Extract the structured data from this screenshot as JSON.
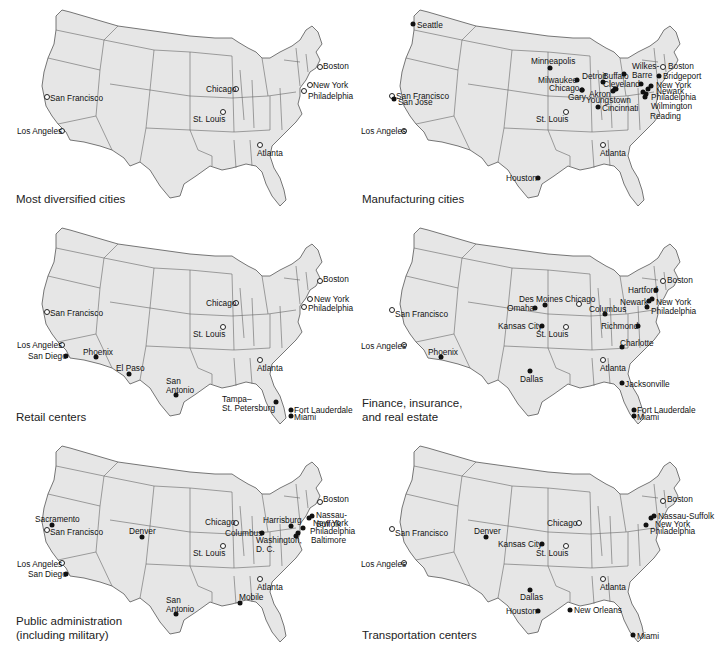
{
  "colors": {
    "land": "#e6e6e6",
    "border": "#555555",
    "dot": "#111111",
    "background": "#ffffff"
  },
  "legend": {
    "filled_dot": "city in category",
    "open_dot": "diversified reference city"
  },
  "panels": [
    {
      "id": "diversified",
      "caption": "Most diversified cities",
      "left": 0,
      "top": 0,
      "cities": [
        {
          "name": "Boston",
          "x": 320,
          "y": 67,
          "tx": 323,
          "ty": 62,
          "open": true
        },
        {
          "name": "New York",
          "x": 310,
          "y": 85,
          "tx": 313,
          "ty": 81,
          "open": true
        },
        {
          "name": "Philadelphia",
          "x": 304,
          "y": 91,
          "tx": 308,
          "ty": 92,
          "open": true
        },
        {
          "name": "Chicago",
          "x": 236,
          "y": 89,
          "tx": 206,
          "ty": 85,
          "open": true
        },
        {
          "name": "San Francisco",
          "x": 47,
          "y": 97,
          "tx": 50,
          "ty": 94,
          "open": true
        },
        {
          "name": "St. Louis",
          "x": 223,
          "y": 112,
          "tx": 193,
          "ty": 115,
          "open": true
        },
        {
          "name": "Los Angeles",
          "x": 62,
          "y": 131,
          "tx": 17,
          "ty": 127,
          "open": true
        },
        {
          "name": "Atlanta",
          "x": 260,
          "y": 145,
          "tx": 257,
          "ty": 149,
          "open": true
        }
      ]
    },
    {
      "id": "manufacturing",
      "caption": "Manufacturing cities",
      "left": 358,
      "top": 0,
      "cities": [
        {
          "name": "Seattle",
          "x": 55,
          "y": 24,
          "tx": 59,
          "ty": 21,
          "open": false
        },
        {
          "name": "Minneapolis",
          "x": 192,
          "y": 68,
          "tx": 173,
          "ty": 57,
          "open": false
        },
        {
          "name": "Boston",
          "x": 305,
          "y": 67,
          "tx": 310,
          "ty": 62,
          "open": true
        },
        {
          "name": "Wilkes-\nBarre",
          "x": 283,
          "y": 84,
          "tx": 274,
          "ty": 62,
          "open": false
        },
        {
          "name": "Buffalo",
          "x": 266,
          "y": 74,
          "tx": 245,
          "ty": 72,
          "open": false
        },
        {
          "name": "Bridgeport",
          "x": 301,
          "y": 76,
          "tx": 305,
          "ty": 72,
          "open": false
        },
        {
          "name": "Detroit",
          "x": 245,
          "y": 82,
          "tx": 224,
          "ty": 72,
          "open": false
        },
        {
          "name": "Milwaukee",
          "x": 219,
          "y": 80,
          "tx": 180,
          "ty": 76,
          "open": false
        },
        {
          "name": "Cleveland",
          "x": 257,
          "y": 89,
          "tx": 245,
          "ty": 80,
          "open": false
        },
        {
          "name": "New York",
          "x": 293,
          "y": 86,
          "tx": 298,
          "ty": 81,
          "open": false
        },
        {
          "name": "Chicago",
          "x": 224,
          "y": 90,
          "tx": 191,
          "ty": 84,
          "open": false
        },
        {
          "name": "Akron",
          "x": 255,
          "y": 91,
          "tx": 231,
          "ty": 90,
          "open": false
        },
        {
          "name": "Newark",
          "x": 290,
          "y": 89,
          "tx": 298,
          "ty": 87,
          "open": false
        },
        {
          "name": "San Francisco",
          "x": 34,
          "y": 96,
          "tx": 38,
          "ty": 92,
          "open": true
        },
        {
          "name": "San Jose",
          "x": 36,
          "y": 99,
          "tx": 40,
          "ty": 98,
          "open": false
        },
        {
          "name": "Youngstown",
          "x": 258,
          "y": 89,
          "tx": 228,
          "ty": 96,
          "open": false
        },
        {
          "name": "Gary",
          "x": 224,
          "y": 90,
          "tx": 210,
          "ty": 93,
          "open": false
        },
        {
          "name": "Philadelphia",
          "x": 288,
          "y": 94,
          "tx": 293,
          "ty": 93,
          "open": false
        },
        {
          "name": "Cincinnati",
          "x": 240,
          "y": 107,
          "tx": 244,
          "ty": 104,
          "open": false
        },
        {
          "name": "Wilmington",
          "x": 287,
          "y": 97,
          "tx": 293,
          "ty": 102,
          "open": false
        },
        {
          "name": "St. Louis",
          "x": 208,
          "y": 112,
          "tx": 178,
          "ty": 115,
          "open": true
        },
        {
          "name": "Reading",
          "x": 285,
          "y": 92,
          "tx": 292,
          "ty": 112,
          "open": false
        },
        {
          "name": "Los Angeles",
          "x": 46,
          "y": 131,
          "tx": 3,
          "ty": 127,
          "open": true
        },
        {
          "name": "Atlanta",
          "x": 245,
          "y": 145,
          "tx": 242,
          "ty": 149,
          "open": true
        },
        {
          "name": "Houston",
          "x": 180,
          "y": 178,
          "tx": 148,
          "ty": 174,
          "open": false
        }
      ]
    },
    {
      "id": "retail",
      "caption": "Retail centers",
      "left": 0,
      "top": 218,
      "cities": [
        {
          "name": "Boston",
          "x": 320,
          "y": 63,
          "tx": 323,
          "ty": 57,
          "open": true
        },
        {
          "name": "New York",
          "x": 310,
          "y": 81,
          "tx": 314,
          "ty": 77,
          "open": true
        },
        {
          "name": "Chicago",
          "x": 236,
          "y": 85,
          "tx": 206,
          "ty": 81,
          "open": true
        },
        {
          "name": "Philadelphia",
          "x": 304,
          "y": 89,
          "tx": 308,
          "ty": 86,
          "open": true
        },
        {
          "name": "San Francisco",
          "x": 47,
          "y": 94,
          "tx": 50,
          "ty": 91,
          "open": true
        },
        {
          "name": "St. Louis",
          "x": 223,
          "y": 109,
          "tx": 193,
          "ty": 112,
          "open": true
        },
        {
          "name": "Los Angeles",
          "x": 62,
          "y": 127,
          "tx": 17,
          "ty": 123,
          "open": true
        },
        {
          "name": "San Diego",
          "x": 66,
          "y": 138,
          "tx": 28,
          "ty": 134,
          "open": false
        },
        {
          "name": "Phoenix",
          "x": 96,
          "y": 139,
          "tx": 83,
          "ty": 130,
          "open": false
        },
        {
          "name": "El Paso",
          "x": 129,
          "y": 156,
          "tx": 116,
          "ty": 146,
          "open": false
        },
        {
          "name": "Atlanta",
          "x": 260,
          "y": 142,
          "tx": 257,
          "ty": 146,
          "open": true
        },
        {
          "name": "San\nAntonio",
          "x": 176,
          "y": 177,
          "tx": 166,
          "ty": 159,
          "open": false
        },
        {
          "name": "Tampa–\nSt. Petersburg",
          "x": 276,
          "y": 184,
          "tx": 222,
          "ty": 177,
          "open": false
        },
        {
          "name": "Fort Lauderdale",
          "x": 291,
          "y": 192,
          "tx": 294,
          "ty": 188,
          "open": false
        },
        {
          "name": "Miami",
          "x": 291,
          "y": 198,
          "tx": 294,
          "ty": 195,
          "open": false
        }
      ]
    },
    {
      "id": "finance",
      "caption": "Finance, insurance,\nand real estate",
      "left": 358,
      "top": 218,
      "cities": [
        {
          "name": "Boston",
          "x": 305,
          "y": 63,
          "tx": 309,
          "ty": 58,
          "open": true
        },
        {
          "name": "Hartford",
          "x": 298,
          "y": 72,
          "tx": 270,
          "ty": 68,
          "open": false
        },
        {
          "name": "Newark",
          "x": 291,
          "y": 83,
          "tx": 262,
          "ty": 80,
          "open": false
        },
        {
          "name": "New York",
          "x": 294,
          "y": 81,
          "tx": 298,
          "ty": 80,
          "open": false
        },
        {
          "name": "Des Moines",
          "x": 187,
          "y": 87,
          "tx": 161,
          "ty": 77,
          "open": false
        },
        {
          "name": "Chicago",
          "x": 221,
          "y": 86,
          "tx": 207,
          "ty": 77,
          "open": true
        },
        {
          "name": "Philadelphia",
          "x": 289,
          "y": 89,
          "tx": 293,
          "ty": 89,
          "open": false
        },
        {
          "name": "Omaha",
          "x": 177,
          "y": 90,
          "tx": 149,
          "ty": 86,
          "open": false
        },
        {
          "name": "Columbus",
          "x": 247,
          "y": 96,
          "tx": 231,
          "ty": 87,
          "open": false
        },
        {
          "name": "San Francisco",
          "x": 34,
          "y": 92,
          "tx": 37,
          "ty": 92,
          "open": true
        },
        {
          "name": "Kansas City",
          "x": 184,
          "y": 108,
          "tx": 140,
          "ty": 104,
          "open": false
        },
        {
          "name": "Richmond",
          "x": 280,
          "y": 108,
          "tx": 243,
          "ty": 104,
          "open": false
        },
        {
          "name": "St. Louis",
          "x": 208,
          "y": 109,
          "tx": 178,
          "ty": 112,
          "open": true
        },
        {
          "name": "Los Angeles",
          "x": 46,
          "y": 127,
          "tx": 3,
          "ty": 124,
          "open": true
        },
        {
          "name": "Phoenix",
          "x": 83,
          "y": 139,
          "tx": 70,
          "ty": 130,
          "open": false
        },
        {
          "name": "Charlotte",
          "x": 264,
          "y": 129,
          "tx": 262,
          "ty": 121,
          "open": false
        },
        {
          "name": "Atlanta",
          "x": 245,
          "y": 142,
          "tx": 242,
          "ty": 146,
          "open": true
        },
        {
          "name": "Dallas",
          "x": 172,
          "y": 153,
          "tx": 162,
          "ty": 157,
          "open": false
        },
        {
          "name": "Jacksonville",
          "x": 264,
          "y": 165,
          "tx": 267,
          "ty": 162,
          "open": false
        },
        {
          "name": "Fort Lauderdale",
          "x": 276,
          "y": 192,
          "tx": 279,
          "ty": 188,
          "open": false
        },
        {
          "name": "Miami",
          "x": 276,
          "y": 198,
          "tx": 279,
          "ty": 195,
          "open": false
        }
      ]
    },
    {
      "id": "public-admin",
      "caption": "Public administration\n(including military)",
      "left": 0,
      "top": 436,
      "cities": [
        {
          "name": "Boston",
          "x": 320,
          "y": 66,
          "tx": 323,
          "ty": 59,
          "open": true
        },
        {
          "name": "Nassau-Suffolk",
          "x": 312,
          "y": 80,
          "tx": 316,
          "ty": 75,
          "open": false
        },
        {
          "name": "Sacramento",
          "x": 52,
          "y": 89,
          "tx": 35,
          "ty": 79,
          "open": false
        },
        {
          "name": "Harrisburg",
          "x": 291,
          "y": 90,
          "tx": 263,
          "ty": 80,
          "open": false
        },
        {
          "name": "Chicago",
          "x": 236,
          "y": 87,
          "tx": 205,
          "ty": 82,
          "open": true
        },
        {
          "name": "New York",
          "x": 309,
          "y": 82,
          "tx": 313,
          "ty": 83,
          "open": false
        },
        {
          "name": "San Francisco",
          "x": 47,
          "y": 94,
          "tx": 50,
          "ty": 92,
          "open": true
        },
        {
          "name": "Denver",
          "x": 142,
          "y": 101,
          "tx": 129,
          "ty": 91,
          "open": false
        },
        {
          "name": "Columbus",
          "x": 262,
          "y": 97,
          "tx": 225,
          "ty": 93,
          "open": false
        },
        {
          "name": "Philadelphia",
          "x": 303,
          "y": 92,
          "tx": 310,
          "ty": 91,
          "open": false
        },
        {
          "name": "Baltimore",
          "x": 298,
          "y": 97,
          "tx": 311,
          "ty": 100,
          "open": false
        },
        {
          "name": "Washington,\nD. C.",
          "x": 296,
          "y": 100,
          "tx": 256,
          "ty": 100,
          "open": false
        },
        {
          "name": "St. Louis",
          "x": 223,
          "y": 110,
          "tx": 193,
          "ty": 113,
          "open": true
        },
        {
          "name": "Los Angeles",
          "x": 62,
          "y": 127,
          "tx": 17,
          "ty": 124,
          "open": true
        },
        {
          "name": "San Diego",
          "x": 66,
          "y": 138,
          "tx": 28,
          "ty": 134,
          "open": false
        },
        {
          "name": "Atlanta",
          "x": 260,
          "y": 143,
          "tx": 257,
          "ty": 147,
          "open": true
        },
        {
          "name": "Mobile",
          "x": 240,
          "y": 167,
          "tx": 239,
          "ty": 157,
          "open": false
        },
        {
          "name": "San\nAntonio",
          "x": 176,
          "y": 178,
          "tx": 166,
          "ty": 160,
          "open": false
        }
      ]
    },
    {
      "id": "transportation",
      "caption": "Transportation centers",
      "left": 358,
      "top": 436,
      "cities": [
        {
          "name": "Boston",
          "x": 305,
          "y": 65,
          "tx": 309,
          "ty": 59,
          "open": true
        },
        {
          "name": "Nassau-Suffolk",
          "x": 296,
          "y": 80,
          "tx": 300,
          "ty": 76,
          "open": false
        },
        {
          "name": "New York",
          "x": 293,
          "y": 82,
          "tx": 297,
          "ty": 84,
          "open": false
        },
        {
          "name": "Chicago",
          "x": 221,
          "y": 87,
          "tx": 189,
          "ty": 83,
          "open": true
        },
        {
          "name": "Philadelphia",
          "x": 288,
          "y": 89,
          "tx": 292,
          "ty": 91,
          "open": false
        },
        {
          "name": "San Francisco",
          "x": 34,
          "y": 93,
          "tx": 37,
          "ty": 93,
          "open": true
        },
        {
          "name": "Denver",
          "x": 128,
          "y": 101,
          "tx": 116,
          "ty": 91,
          "open": false
        },
        {
          "name": "Kansas City",
          "x": 184,
          "y": 108,
          "tx": 140,
          "ty": 104,
          "open": false
        },
        {
          "name": "St. Louis",
          "x": 208,
          "y": 110,
          "tx": 178,
          "ty": 113,
          "open": true
        },
        {
          "name": "Los Angeles",
          "x": 46,
          "y": 127,
          "tx": 3,
          "ty": 124,
          "open": true
        },
        {
          "name": "Atlanta",
          "x": 245,
          "y": 143,
          "tx": 242,
          "ty": 147,
          "open": true
        },
        {
          "name": "Dallas",
          "x": 172,
          "y": 154,
          "tx": 162,
          "ty": 157,
          "open": false
        },
        {
          "name": "Houston",
          "x": 180,
          "y": 175,
          "tx": 148,
          "ty": 171,
          "open": false
        },
        {
          "name": "New Orleans",
          "x": 212,
          "y": 174,
          "tx": 216,
          "ty": 170,
          "open": false
        },
        {
          "name": "Miami",
          "x": 275,
          "y": 199,
          "tx": 279,
          "ty": 196,
          "open": false
        }
      ]
    }
  ]
}
